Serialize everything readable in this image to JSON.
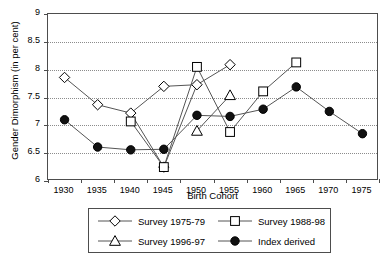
{
  "chart_data": {
    "type": "line",
    "title": "",
    "xlabel": "Birth Cohort",
    "ylabel": "Gender Dimorphism (in per cent)",
    "categories": [
      "1930",
      "1935",
      "1940",
      "1945",
      "1950",
      "1955",
      "1960",
      "1965",
      "1970",
      "1975"
    ],
    "ylim": [
      6,
      9
    ],
    "ytick_step": 0.5,
    "yticks": [
      "6",
      "6.5",
      "7",
      "7.5",
      "8",
      "8.5",
      "9"
    ],
    "grid": "horizontal-dotted",
    "legend_position": "bottom",
    "series": [
      {
        "name": "Survey 1975-79",
        "marker": "diamond-open",
        "values": [
          7.86,
          7.37,
          7.22,
          6.25,
          7.73,
          8.09,
          null,
          null,
          null,
          null
        ],
        "points": [
          {
            "x": "1930",
            "y": 7.86
          },
          {
            "x": "1935",
            "y": 7.37
          },
          {
            "x": "1940",
            "y": 7.22
          },
          {
            "x": "1945",
            "y": 6.25
          },
          {
            "x": "1950",
            "y": 7.73
          },
          {
            "x": "1955",
            "y": 8.09
          }
        ],
        "extra_point": {
          "x": "1945",
          "y": 7.7,
          "note": "marker at 1945 tick position upper"
        }
      },
      {
        "name": "Survey 1988-98",
        "marker": "square-open",
        "values": [
          null,
          null,
          7.07,
          6.25,
          8.05,
          6.88,
          7.61,
          8.13,
          null,
          null
        ],
        "points": [
          {
            "x": "1940",
            "y": 7.07
          },
          {
            "x": "1945",
            "y": 6.25
          },
          {
            "x": "1950",
            "y": 8.05
          },
          {
            "x": "1955",
            "y": 6.88
          },
          {
            "x": "1960",
            "y": 7.61
          },
          {
            "x": "1965",
            "y": 8.13
          }
        ]
      },
      {
        "name": "Survey 1996-97",
        "marker": "triangle-open",
        "values": [
          null,
          null,
          null,
          null,
          6.9,
          7.54,
          null,
          null,
          null,
          null
        ],
        "points": [
          {
            "x": "1950",
            "y": 6.9
          },
          {
            "x": "1955",
            "y": 7.54
          }
        ]
      },
      {
        "name": "Index derived",
        "marker": "circle-filled",
        "values": [
          7.1,
          6.61,
          6.56,
          6.57,
          7.18,
          7.16,
          7.29,
          7.69,
          7.25,
          6.85
        ],
        "points": [
          {
            "x": "1930",
            "y": 7.1
          },
          {
            "x": "1935",
            "y": 6.61
          },
          {
            "x": "1940",
            "y": 6.56
          },
          {
            "x": "1945",
            "y": 6.57
          },
          {
            "x": "1950",
            "y": 7.18
          },
          {
            "x": "1955",
            "y": 7.16
          },
          {
            "x": "1960",
            "y": 7.29
          },
          {
            "x": "1965",
            "y": 7.69
          },
          {
            "x": "1970",
            "y": 7.25
          },
          {
            "x": "1975",
            "y": 6.85
          }
        ]
      }
    ],
    "colors": {
      "axis": "#4d4d4d",
      "grid": "#8c8c8c",
      "line": "#555555",
      "marker_stroke": "#000000",
      "marker_fill_open": "#ffffff",
      "marker_fill_solid": "#111111",
      "text": "#000000"
    }
  },
  "legend": {
    "items": [
      {
        "label": "Survey 1975-79",
        "marker": "diamond-open"
      },
      {
        "label": "Survey 1988-98",
        "marker": "square-open"
      },
      {
        "label": "Survey 1996-97",
        "marker": "triangle-open"
      },
      {
        "label": "Index derived",
        "marker": "circle-filled"
      }
    ]
  }
}
